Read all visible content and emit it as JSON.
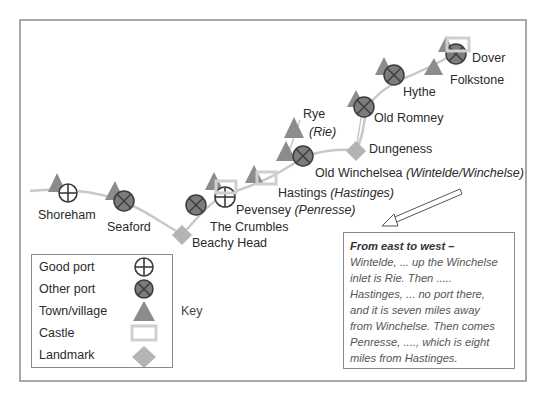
{
  "map": {
    "places": [
      {
        "name": "Shoreham",
        "symbols": [
          "town",
          "good-port"
        ]
      },
      {
        "name": "Seaford",
        "symbols": [
          "town",
          "other-port"
        ]
      },
      {
        "name": "Beachy Head",
        "symbols": [
          "landmark"
        ]
      },
      {
        "name": "The Crumbles",
        "symbols": [
          "other-port"
        ]
      },
      {
        "name": "Pevensey",
        "alt": "(Penresse)",
        "symbols": [
          "town",
          "castle",
          "good-port"
        ]
      },
      {
        "name": "Hastings",
        "alt": "(Hastinges)",
        "symbols": [
          "town",
          "castle"
        ]
      },
      {
        "name": "Rye",
        "alt": "(Rie)",
        "symbols": [
          "town"
        ]
      },
      {
        "name": "Old Winchelsea",
        "alt": "(Wintelde/Winchelse)",
        "symbols": [
          "town",
          "other-port"
        ]
      },
      {
        "name": "Dungeness",
        "symbols": [
          "landmark"
        ]
      },
      {
        "name": "Old Romney",
        "symbols": [
          "town",
          "other-port"
        ]
      },
      {
        "name": "Hythe",
        "symbols": [
          "town",
          "other-port"
        ]
      },
      {
        "name": "Folkstone",
        "symbols": [
          "town"
        ]
      },
      {
        "name": "Dover",
        "symbols": [
          "town",
          "castle",
          "other-port"
        ]
      }
    ]
  },
  "legend": {
    "title": "Key",
    "items": [
      {
        "label": "Good port",
        "symbol": "circle-plus-icon"
      },
      {
        "label": "Other port",
        "symbol": "circle-x-icon"
      },
      {
        "label": "Town/village",
        "symbol": "triangle-icon"
      },
      {
        "label": "Castle",
        "symbol": "rectangle-icon"
      },
      {
        "label": "Landmark",
        "symbol": "diamond-icon"
      }
    ]
  },
  "quote": {
    "heading": "From east to west –",
    "lines": [
      "Wintelde, ... up the Winchelse",
      "inlet is Rie. Then .....",
      "Hastinges, ... no port there,",
      "and it is seven miles away",
      "from Winchelse. Then comes",
      "Penresse, ...., which is eight",
      "miles from Hastinges."
    ]
  },
  "colors": {
    "coast": "#c8c8c8",
    "triangle": "#8c8c8c",
    "port_fill": "#7c7c7c",
    "stroke": "#3c3c3c",
    "castle": "#cfcfcf",
    "landmark": "#b4b4b4"
  }
}
